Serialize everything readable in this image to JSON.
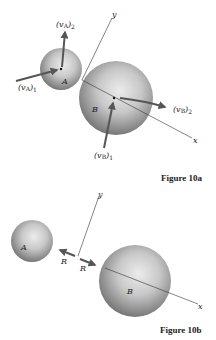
{
  "figure_a": {
    "caption": "Figure 10a",
    "sphere_a_label": "A",
    "sphere_b_label": "B",
    "axis_x_label": "x",
    "axis_y_label": "y",
    "vectors": {
      "va1": {
        "base": "(v",
        "sub1": "A",
        "close": ")",
        "sub2": "1"
      },
      "va2": {
        "base": "(v",
        "sub1": "A",
        "close": ")",
        "sub2": "2"
      },
      "vb1": {
        "base": "(v",
        "sub1": "B",
        "close": ")",
        "sub2": "1"
      },
      "vb2": {
        "base": "(v",
        "sub1": "B",
        "close": ")",
        "sub2": "2"
      }
    }
  },
  "figure_b": {
    "caption": "Figure 10b",
    "sphere_a_label": "A",
    "sphere_b_label": "B",
    "axis_x_label": "x",
    "axis_y_label": "y",
    "force_left_label": "R",
    "force_right_label": "R"
  },
  "colors": {
    "arrow": "#555555",
    "axis": "#333333",
    "sphere_light": "#e6e6e6",
    "sphere_dark": "#6a6a6a"
  }
}
